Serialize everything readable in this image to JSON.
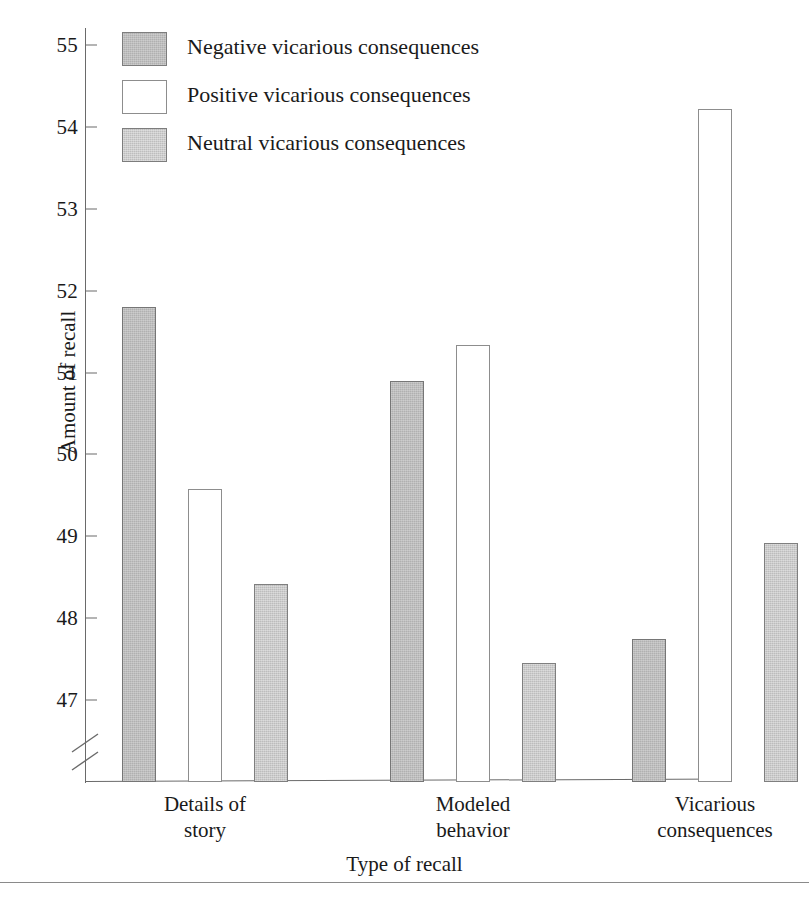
{
  "chart_data": {
    "type": "bar",
    "title": "",
    "xlabel": "Type of recall",
    "ylabel": "Amount of recall",
    "categories": [
      "Details of\nstory",
      "Modeled\nbehavior",
      "Vicarious\nconsequences"
    ],
    "category_labels_flat": [
      "Details of story",
      "Modeled behavior",
      "Vicarious consequences"
    ],
    "series": [
      {
        "name": "Negative vicarious consequences",
        "color": "#b0b0b0",
        "values": [
          51.8,
          50.9,
          47.75
        ]
      },
      {
        "name": "Positive vicarious consequences",
        "color": "#ffffff",
        "values": [
          49.58,
          51.33,
          54.22
        ]
      },
      {
        "name": "Neutral vicarious consequences",
        "color": "#bdbdbd",
        "values": [
          48.42,
          47.45,
          48.92
        ]
      }
    ],
    "ylim": [
      46.4,
      55.4
    ],
    "yticks": [
      47,
      48,
      49,
      50,
      51,
      52,
      53,
      54,
      55
    ],
    "ytick_labels": [
      "47",
      "48",
      "49",
      "50",
      "51",
      "52",
      "53",
      "54",
      "55"
    ],
    "axis_break": true,
    "axis_break_note": "broken y-axis below 47",
    "grid": false,
    "legend_position": "top-left-inside"
  },
  "legend": {
    "items": [
      {
        "label": "Negative vicarious consequences",
        "swatch": "negative-swatch"
      },
      {
        "label": "Positive vicarious consequences",
        "swatch": "positive-swatch"
      },
      {
        "label": "Neutral vicarious consequences",
        "swatch": "neutral-swatch"
      }
    ]
  },
  "axes": {
    "y_title": "Amount of recall",
    "x_title": "Type of recall",
    "y_ticks": [
      "55",
      "54",
      "53",
      "52",
      "51",
      "50",
      "49",
      "48",
      "47"
    ]
  },
  "colors": {
    "axis": "#6a6a6a",
    "bar_outline": "#7d7d7d",
    "negative": "#b0b0b0",
    "positive": "#ffffff",
    "neutral": "#bdbdbd",
    "text": "#1a1a1a",
    "rule": "#8a8a8a",
    "background": "#ffffff"
  }
}
